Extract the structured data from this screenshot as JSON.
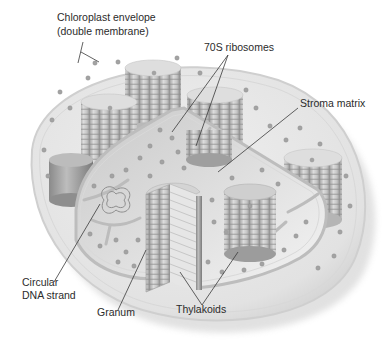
{
  "figure": {
    "labels": {
      "envelope_line1": "Chloroplast envelope",
      "envelope_line2": "(double membrane)",
      "ribosomes": "70S ribosomes",
      "stroma": "Stroma matrix",
      "dna_line1": "Circular",
      "dna_line2": "DNA strand",
      "granum": "Granum",
      "thylakoids": "Thylakoids"
    },
    "colors": {
      "background": "#ffffff",
      "envelope_fill": "#e9e9e9",
      "envelope_edge": "#cfcfcf",
      "stroma_fill": "#d9d9d9",
      "cut_face": "#f2f2f2",
      "granum_light": "#c8c8c8",
      "granum_dark": "#8f8f8f",
      "ribosome": "#9a9a9a",
      "leader_line": "#3a3a3a",
      "text": "#2b2b2b"
    }
  }
}
